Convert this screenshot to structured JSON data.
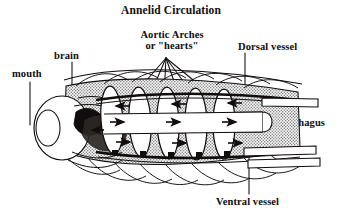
{
  "figure": {
    "title": "Annelid Circulation",
    "background_color": "#ffffff",
    "ink_color": "#100d0c",
    "shade_color": "#b9b9b9"
  },
  "labels": {
    "title": "Annelid Circulation",
    "aortic_arches_line1": "Aortic Arches",
    "aortic_arches_line2": "or \"hearts\"",
    "dorsal_vessel": "Dorsal vessel",
    "brain": "brain",
    "mouth": "mouth",
    "esophagus": "esophagus",
    "ventral_vessel": "Ventral vessel"
  },
  "structures": [
    {
      "name": "mouth",
      "description": "anterior oral opening, oval"
    },
    {
      "name": "brain",
      "description": "dorsal cerebral ganglion behind mouth"
    },
    {
      "name": "aortic-arches",
      "description": "five paired looping hearts encircling esophagus"
    },
    {
      "name": "dorsal-vessel",
      "description": "longitudinal vessel along dorsal surface"
    },
    {
      "name": "esophagus",
      "description": "central tube running posteriorly"
    },
    {
      "name": "ventral-vessel",
      "description": "longitudinal vessel along ventral surface"
    },
    {
      "name": "body-segments",
      "description": "overlapping scalloped segmental body wall"
    },
    {
      "name": "flow-arrows",
      "description": "arrowheads indicating direction of blood flow"
    }
  ]
}
